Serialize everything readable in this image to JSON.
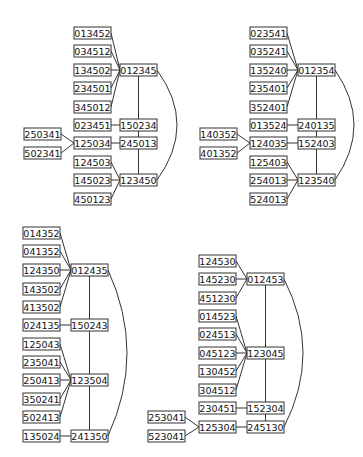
{
  "diagram": {
    "box_width": 37,
    "box_height": 12,
    "graphs": [
      {
        "id": "g1",
        "nodes": [
          {
            "id": "013452",
            "x": 74,
            "y": 27
          },
          {
            "id": "034512",
            "x": 74,
            "y": 45
          },
          {
            "id": "134502",
            "x": 74,
            "y": 64
          },
          {
            "id": "234501",
            "x": 74,
            "y": 82
          },
          {
            "id": "345012",
            "x": 74,
            "y": 101
          },
          {
            "id": "012345",
            "x": 120,
            "y": 64
          },
          {
            "id": "023451",
            "x": 74,
            "y": 119
          },
          {
            "id": "150234",
            "x": 120,
            "y": 119
          },
          {
            "id": "250341",
            "x": 24,
            "y": 128
          },
          {
            "id": "502341",
            "x": 24,
            "y": 147
          },
          {
            "id": "125034",
            "x": 74,
            "y": 137
          },
          {
            "id": "245013",
            "x": 120,
            "y": 137
          },
          {
            "id": "124503",
            "x": 74,
            "y": 156
          },
          {
            "id": "145023",
            "x": 74,
            "y": 174
          },
          {
            "id": "123450",
            "x": 120,
            "y": 174
          },
          {
            "id": "450123",
            "x": 74,
            "y": 193
          }
        ],
        "edges": [
          [
            "013452",
            "012345"
          ],
          [
            "034512",
            "012345"
          ],
          [
            "134502",
            "012345"
          ],
          [
            "234501",
            "012345"
          ],
          [
            "345012",
            "012345"
          ],
          [
            "023451",
            "150234"
          ],
          [
            "250341",
            "125034"
          ],
          [
            "502341",
            "125034"
          ],
          [
            "125034",
            "245013"
          ],
          [
            "012345",
            "150234"
          ],
          [
            "150234",
            "245013"
          ],
          [
            "245013",
            "123450"
          ],
          [
            "124503",
            "123450"
          ],
          [
            "145023",
            "123450"
          ],
          [
            "450123",
            "123450"
          ]
        ],
        "arc": {
          "from": "012345",
          "to": "123450",
          "bulge_x": 177
        }
      },
      {
        "id": "g2",
        "nodes": [
          {
            "id": "023541",
            "x": 250,
            "y": 27
          },
          {
            "id": "035241",
            "x": 250,
            "y": 45
          },
          {
            "id": "135240",
            "x": 250,
            "y": 64
          },
          {
            "id": "235401",
            "x": 250,
            "y": 82
          },
          {
            "id": "352401",
            "x": 250,
            "y": 101
          },
          {
            "id": "012354",
            "x": 298,
            "y": 64
          },
          {
            "id": "013524",
            "x": 250,
            "y": 119
          },
          {
            "id": "240135",
            "x": 298,
            "y": 119
          },
          {
            "id": "140352",
            "x": 200,
            "y": 128
          },
          {
            "id": "401352",
            "x": 200,
            "y": 147
          },
          {
            "id": "124035",
            "x": 250,
            "y": 137
          },
          {
            "id": "152403",
            "x": 298,
            "y": 137
          },
          {
            "id": "125403",
            "x": 250,
            "y": 156
          },
          {
            "id": "254013",
            "x": 250,
            "y": 174
          },
          {
            "id": "123540",
            "x": 298,
            "y": 174
          },
          {
            "id": "524013",
            "x": 250,
            "y": 193
          }
        ],
        "edges": [
          [
            "023541",
            "012354"
          ],
          [
            "035241",
            "012354"
          ],
          [
            "135240",
            "012354"
          ],
          [
            "235401",
            "012354"
          ],
          [
            "352401",
            "012354"
          ],
          [
            "013524",
            "240135"
          ],
          [
            "140352",
            "124035"
          ],
          [
            "401352",
            "124035"
          ],
          [
            "124035",
            "152403"
          ],
          [
            "012354",
            "240135"
          ],
          [
            "240135",
            "152403"
          ],
          [
            "152403",
            "123540"
          ],
          [
            "125403",
            "123540"
          ],
          [
            "254013",
            "123540"
          ],
          [
            "524013",
            "123540"
          ]
        ],
        "arc": {
          "from": "012354",
          "to": "123540",
          "bulge_x": 354
        }
      },
      {
        "id": "g3",
        "nodes": [
          {
            "id": "014352",
            "x": 23,
            "y": 227
          },
          {
            "id": "041352",
            "x": 23,
            "y": 245
          },
          {
            "id": "124350",
            "x": 23,
            "y": 264
          },
          {
            "id": "143502",
            "x": 23,
            "y": 283
          },
          {
            "id": "413502",
            "x": 23,
            "y": 301
          },
          {
            "id": "012435",
            "x": 71,
            "y": 264
          },
          {
            "id": "024135",
            "x": 23,
            "y": 319
          },
          {
            "id": "150243",
            "x": 71,
            "y": 319
          },
          {
            "id": "125043",
            "x": 23,
            "y": 338
          },
          {
            "id": "235041",
            "x": 23,
            "y": 356
          },
          {
            "id": "250413",
            "x": 23,
            "y": 374
          },
          {
            "id": "123504",
            "x": 71,
            "y": 374
          },
          {
            "id": "350241",
            "x": 23,
            "y": 393
          },
          {
            "id": "502413",
            "x": 23,
            "y": 411
          },
          {
            "id": "135024",
            "x": 23,
            "y": 430
          },
          {
            "id": "241350",
            "x": 71,
            "y": 430
          }
        ],
        "edges": [
          [
            "014352",
            "012435"
          ],
          [
            "041352",
            "012435"
          ],
          [
            "124350",
            "012435"
          ],
          [
            "143502",
            "012435"
          ],
          [
            "413502",
            "012435"
          ],
          [
            "024135",
            "150243"
          ],
          [
            "012435",
            "150243"
          ],
          [
            "150243",
            "123504"
          ],
          [
            "123504",
            "241350"
          ],
          [
            "125043",
            "123504"
          ],
          [
            "235041",
            "123504"
          ],
          [
            "250413",
            "123504"
          ],
          [
            "350241",
            "123504"
          ],
          [
            "502413",
            "123504"
          ],
          [
            "135024",
            "241350"
          ]
        ],
        "arc": {
          "from": "012435",
          "to": "241350",
          "bulge_x": 127
        }
      },
      {
        "id": "g4",
        "nodes": [
          {
            "id": "124530",
            "x": 199,
            "y": 255
          },
          {
            "id": "145230",
            "x": 199,
            "y": 273
          },
          {
            "id": "451230",
            "x": 199,
            "y": 292
          },
          {
            "id": "012453",
            "x": 247,
            "y": 273
          },
          {
            "id": "014523",
            "x": 199,
            "y": 310
          },
          {
            "id": "024513",
            "x": 199,
            "y": 328
          },
          {
            "id": "045123",
            "x": 199,
            "y": 347
          },
          {
            "id": "123045",
            "x": 247,
            "y": 347
          },
          {
            "id": "130452",
            "x": 199,
            "y": 365
          },
          {
            "id": "304512",
            "x": 199,
            "y": 384
          },
          {
            "id": "230451",
            "x": 199,
            "y": 402
          },
          {
            "id": "152304",
            "x": 247,
            "y": 402
          },
          {
            "id": "253041",
            "x": 148,
            "y": 411
          },
          {
            "id": "523041",
            "x": 148,
            "y": 430
          },
          {
            "id": "125304",
            "x": 199,
            "y": 421
          },
          {
            "id": "245130",
            "x": 247,
            "y": 421
          }
        ],
        "edges": [
          [
            "124530",
            "012453"
          ],
          [
            "145230",
            "012453"
          ],
          [
            "451230",
            "012453"
          ],
          [
            "014523",
            "123045"
          ],
          [
            "024513",
            "123045"
          ],
          [
            "045123",
            "123045"
          ],
          [
            "130452",
            "123045"
          ],
          [
            "304512",
            "123045"
          ],
          [
            "012453",
            "123045"
          ],
          [
            "123045",
            "152304"
          ],
          [
            "152304",
            "245130"
          ],
          [
            "230451",
            "152304"
          ],
          [
            "253041",
            "125304"
          ],
          [
            "523041",
            "125304"
          ],
          [
            "125304",
            "245130"
          ]
        ],
        "arc": {
          "from": "012453",
          "to": "245130",
          "bulge_x": 303
        }
      }
    ]
  }
}
